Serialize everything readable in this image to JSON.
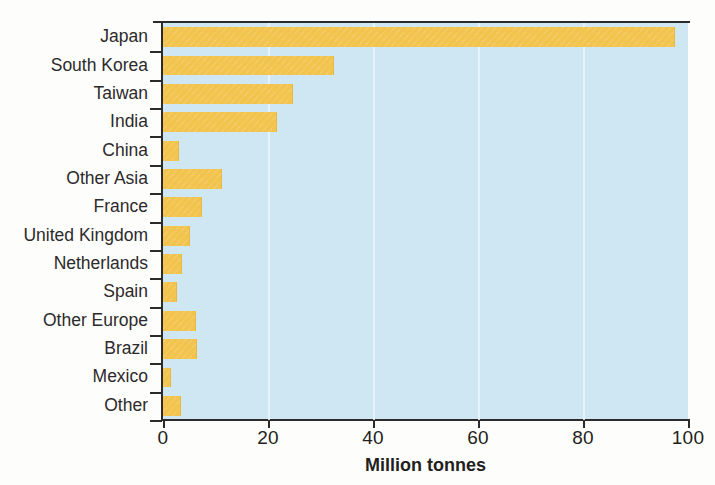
{
  "chart_data": {
    "type": "bar",
    "orientation": "horizontal",
    "title": "",
    "xlabel": "Million tonnes",
    "ylabel": "",
    "xlim": [
      0,
      100
    ],
    "xticks": [
      0,
      20,
      40,
      60,
      80,
      100
    ],
    "xtick_labels": [
      "0",
      "20",
      "40",
      "60",
      "80",
      "100"
    ],
    "grid": "vertical",
    "legend": "none",
    "categories": [
      "Japan",
      "South Korea",
      "Taiwan",
      "India",
      "China",
      "Other Asia",
      "France",
      "United Kingdom",
      "Netherlands",
      "Spain",
      "Other Europe",
      "Brazil",
      "Mexico",
      "Other"
    ],
    "values": [
      97.5,
      32.5,
      24.8,
      21.7,
      3.1,
      11.2,
      7.4,
      5.2,
      3.7,
      2.6,
      6.3,
      6.4,
      1.5,
      3.5
    ],
    "colors": {
      "bar": "#F2C44E",
      "plot_background": "#CFE7F3",
      "gridline": "#EAF5FB",
      "axis": "#2B2B2B",
      "text": "#231F20"
    }
  }
}
